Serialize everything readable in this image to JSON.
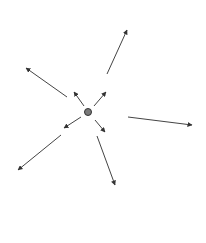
{
  "diagram": {
    "background": "#ffffff",
    "center": {
      "x": 88,
      "y": 112,
      "r": 3.5,
      "fill": "#7a7a7a",
      "stroke": "#333333"
    },
    "arrow_color": "#444444",
    "arrows_inner": [
      {
        "name": "inner-up-left",
        "x1": 84,
        "y1": 106,
        "x2": 74,
        "y2": 92
      },
      {
        "name": "inner-up-right",
        "x1": 94,
        "y1": 106,
        "x2": 106,
        "y2": 92
      },
      {
        "name": "inner-down-left",
        "x1": 81,
        "y1": 117,
        "x2": 64,
        "y2": 128
      },
      {
        "name": "inner-down-right",
        "x1": 95,
        "y1": 120,
        "x2": 105,
        "y2": 132
      }
    ],
    "arrows_outer": [
      {
        "name": "outer-top",
        "x1": 107,
        "y1": 74,
        "x2": 127,
        "y2": 30
      },
      {
        "name": "outer-right",
        "x1": 128,
        "y1": 117,
        "x2": 192,
        "y2": 125
      },
      {
        "name": "outer-upper-left",
        "x1": 67,
        "y1": 97,
        "x2": 26,
        "y2": 68
      },
      {
        "name": "outer-lower-left",
        "x1": 61,
        "y1": 135,
        "x2": 18,
        "y2": 170
      },
      {
        "name": "outer-bottom",
        "x1": 97,
        "y1": 136,
        "x2": 115,
        "y2": 185
      }
    ]
  }
}
